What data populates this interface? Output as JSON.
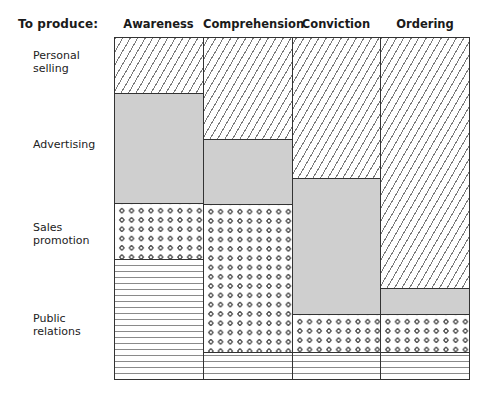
{
  "header": {
    "row_header_title": "To produce:",
    "columns": [
      "Awareness",
      "Comprehension",
      "Conviction",
      "Ordering"
    ]
  },
  "rows": {
    "labels": [
      [
        "Personal",
        "selling"
      ],
      [
        "Advertising"
      ],
      [
        "Sales",
        "promotion"
      ],
      [
        "Public",
        "relations"
      ]
    ]
  },
  "patterns": {
    "personal_selling": "diagonal-hatch",
    "advertising": "solid-gray",
    "sales_promotion": "dots",
    "public_relations": "horizontal-lines"
  },
  "colors": {
    "advertising_fill": "#cfcfcf",
    "outline": "#333333",
    "hatch": "#7a7a7a",
    "dot": "#5a5a5a"
  },
  "chart_data": {
    "type": "bar",
    "stacked": true,
    "normalized": true,
    "title": "",
    "xlabel": "To produce:",
    "ylabel": "",
    "ylim": [
      0,
      100
    ],
    "grid": false,
    "legend_position": "left",
    "categories": [
      "Awareness",
      "Comprehension",
      "Conviction",
      "Ordering"
    ],
    "series": [
      {
        "name": "Personal selling",
        "pattern": "diagonal-hatch",
        "values": [
          16.3,
          30.0,
          41.4,
          73.8
        ]
      },
      {
        "name": "Advertising",
        "pattern": "solid-gray",
        "values": [
          32.4,
          19.0,
          39.9,
          7.6
        ]
      },
      {
        "name": "Sales promotion",
        "pattern": "dots",
        "values": [
          16.3,
          43.4,
          11.1,
          11.1
        ]
      },
      {
        "name": "Public relations",
        "pattern": "horizontal-lines",
        "values": [
          35.0,
          7.6,
          7.6,
          7.6
        ]
      }
    ]
  }
}
